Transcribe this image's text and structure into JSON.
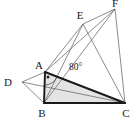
{
  "figure": {
    "background_color": "#ffffff",
    "width": 140,
    "height": 122
  },
  "style": {
    "thin_stroke_color": "#5a5a5a",
    "thin_stroke_width": 0.7,
    "thick_stroke_color": "#1a1a1a",
    "thick_stroke_width": 1.9,
    "shade_fill": "#e4e4e4",
    "shade_opacity": 1,
    "label_color": "#1a1a1a",
    "arc_color": "#3a3a3a",
    "dot_color": "#2a2a2a"
  },
  "points": {
    "A": {
      "name": "A",
      "x": 45,
      "y": 72,
      "label_dx": -6,
      "label_dy": -3
    },
    "B": {
      "name": "B",
      "x": 44,
      "y": 103,
      "label_dx": -2,
      "label_dy": 14
    },
    "C": {
      "name": "C",
      "x": 125,
      "y": 103,
      "label_dx": 1,
      "label_dy": 14
    },
    "D": {
      "name": "D",
      "x": 22,
      "y": 82,
      "label_dx": -14,
      "label_dy": 4
    },
    "E": {
      "name": "E",
      "x": 83,
      "y": 24,
      "label_dx": -3,
      "label_dy": -5
    },
    "F": {
      "name": "F",
      "x": 115,
      "y": 9,
      "label_dx": 0,
      "label_dy": -2
    }
  },
  "labels": {
    "A": "A",
    "B": "B",
    "C": "C",
    "D": "D",
    "E": "E",
    "F": "F"
  },
  "angle": {
    "value": "80",
    "symbol": "°",
    "text": "80°",
    "at_vertex": "A",
    "label_x": 69,
    "label_y": 70
  },
  "shaded_region": {
    "name": "triangle-ABC",
    "vertices": [
      "A",
      "B",
      "C"
    ],
    "fill": "#e4e4e4"
  },
  "thick_edges": [
    {
      "name": "edge-A-B",
      "from": "A",
      "to": "B"
    },
    {
      "name": "edge-B-C",
      "from": "B",
      "to": "C"
    },
    {
      "name": "edge-A-C",
      "from": "A",
      "to": "C"
    }
  ],
  "thin_edges": [
    {
      "name": "edge-D-A",
      "from": "D",
      "to": "A"
    },
    {
      "name": "edge-D-B",
      "from": "D",
      "to": "B"
    },
    {
      "name": "edge-D-C",
      "from": "D",
      "to": "C"
    },
    {
      "name": "edge-A-E",
      "from": "A",
      "to": "E"
    },
    {
      "name": "edge-A-F",
      "from": "A",
      "to": "F"
    },
    {
      "name": "edge-B-E",
      "from": "B",
      "to": "E"
    },
    {
      "name": "edge-B-F",
      "from": "B",
      "to": "F"
    },
    {
      "name": "edge-E-C",
      "from": "E",
      "to": "C"
    },
    {
      "name": "edge-E-F",
      "from": "E",
      "to": "F"
    },
    {
      "name": "edge-F-C",
      "from": "F",
      "to": "C"
    }
  ]
}
